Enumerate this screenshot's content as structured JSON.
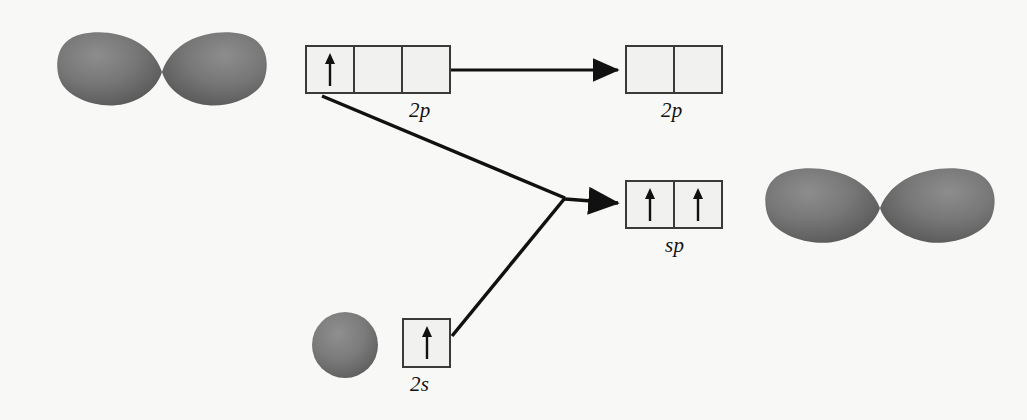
{
  "figure": {
    "background_color": "#f8f8f6",
    "line_color": "#111111",
    "box_border_color": "#3a3a3a",
    "box_fill_color": "#f1f1ef",
    "orbital_color": "#6e6e6e"
  },
  "boxes": {
    "p_initial": {
      "label": "2p",
      "cells": 3,
      "electrons": [
        "up",
        "",
        ""
      ],
      "x": 305,
      "y": 45,
      "width": 146,
      "height": 49
    },
    "p_remaining": {
      "label": "2p",
      "cells": 2,
      "electrons": [
        "",
        ""
      ],
      "x": 625,
      "y": 45,
      "width": 98,
      "height": 49
    },
    "sp_hybrid": {
      "label": "sp",
      "cells": 2,
      "electrons": [
        "up",
        "up"
      ],
      "x": 625,
      "y": 180,
      "width": 98,
      "height": 49
    },
    "s_initial": {
      "label": "2s",
      "cells": 1,
      "electrons": [
        "up"
      ],
      "x": 402,
      "y": 318,
      "width": 49,
      "height": 50
    }
  },
  "labels": {
    "p_initial_label": "2p",
    "p_remaining_label": "2p",
    "sp_label": "sp",
    "s_label": "2s"
  },
  "orbitals": {
    "p_orbital_top_left": {
      "name": "p-orbital-dumbbell",
      "center_x": 162,
      "center_y": 72
    },
    "s_orbital_sphere": {
      "name": "s-orbital-sphere",
      "center_x": 345,
      "center_y": 345,
      "radius": 33
    },
    "sp_orbital_right": {
      "name": "sp-orbital-dumbbell",
      "center_x": 880,
      "center_y": 208
    }
  },
  "connectors": {
    "p_to_p_arrow": {
      "from_x": 451,
      "from_y": 70,
      "to_x": 623,
      "to_y": 70
    },
    "p_to_vertex": {
      "from_x": 322,
      "from_y": 96,
      "to_x": 565,
      "to_y": 198
    },
    "s_to_vertex": {
      "from_x": 452,
      "from_y": 336,
      "to_x": 565,
      "to_y": 198
    },
    "vertex_to_sp_arrow": {
      "from_x": 565,
      "from_y": 198,
      "to_x": 623,
      "to_y": 204
    }
  }
}
